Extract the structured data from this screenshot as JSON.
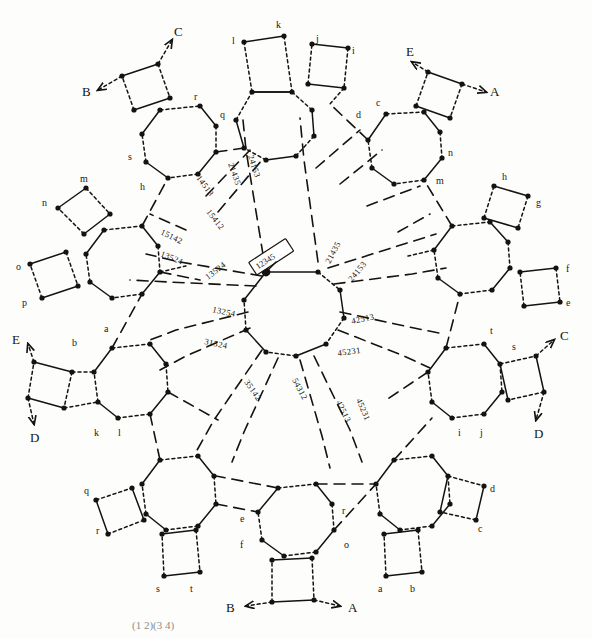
{
  "figure": {
    "caption": "(1 2)(3 4)",
    "center_box_label": "12345"
  },
  "center_ring": {
    "name": "central-octagon",
    "permutation_labels": [
      "12345",
      "21435",
      "24153",
      "42513",
      "45231",
      "54312",
      "35142",
      "31524",
      "13254"
    ]
  },
  "edge_labels_inner": [
    "13254",
    "31524",
    "35142",
    "54312",
    "45231",
    "42513",
    "24153",
    "21435"
  ],
  "spoke_labels": [
    "14513",
    "15412",
    "15142",
    "13524"
  ],
  "arrow_labels": {
    "top_left_out": "C",
    "top_left_in": "B",
    "top_right_in": "E",
    "top_right_out": "A",
    "right_out": "C",
    "right_in": "D",
    "left_in": "E",
    "left_out": "D",
    "bottom_left": "B",
    "bottom_right": "A"
  },
  "satellites": [
    {
      "id": "sat-top",
      "position": "top",
      "vertex_labels": [
        "l",
        "k",
        "j",
        "i"
      ]
    },
    {
      "id": "sat-top-left",
      "position": "top-left",
      "vertex_labels": [
        "r",
        "q",
        "s",
        "h"
      ],
      "arrows": [
        "C",
        "B"
      ]
    },
    {
      "id": "sat-top-right",
      "position": "top-right",
      "vertex_labels": [
        "c",
        "d",
        "n",
        "m"
      ],
      "arrows": [
        "E",
        "A"
      ]
    },
    {
      "id": "sat-left",
      "position": "left",
      "vertex_labels": [
        "m",
        "n",
        "o",
        "p"
      ]
    },
    {
      "id": "sat-right",
      "position": "right",
      "vertex_labels": [
        "h",
        "g",
        "f",
        "e"
      ]
    },
    {
      "id": "sat-lower-left",
      "position": "lower-left",
      "vertex_labels": [
        "a",
        "b",
        "k",
        "l"
      ],
      "arrows": [
        "E",
        "D"
      ]
    },
    {
      "id": "sat-lower-right",
      "position": "lower-right",
      "vertex_labels": [
        "t",
        "s",
        "i",
        "j"
      ],
      "arrows": [
        "C",
        "D"
      ]
    },
    {
      "id": "sat-bottom-left",
      "position": "bottom-left",
      "vertex_labels": [
        "q",
        "r",
        "s",
        "t"
      ]
    },
    {
      "id": "sat-bottom-right",
      "position": "bottom-right",
      "vertex_labels": [
        "d",
        "c",
        "a",
        "b"
      ]
    },
    {
      "id": "sat-bottom",
      "position": "bottom",
      "vertex_labels": [
        "e",
        "f",
        "r",
        "o"
      ],
      "arrows": [
        "B",
        "A"
      ]
    }
  ]
}
